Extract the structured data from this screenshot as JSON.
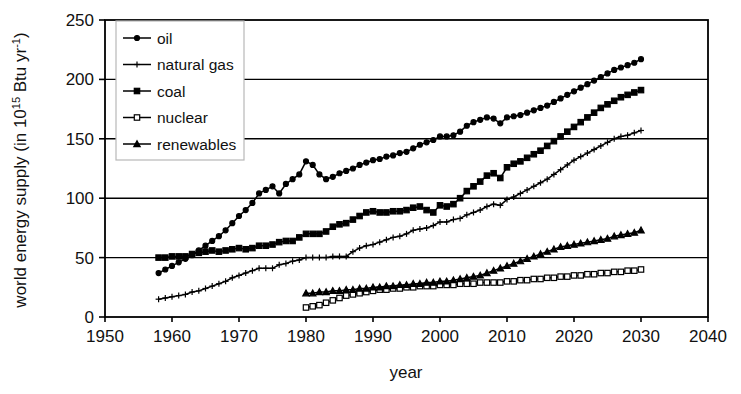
{
  "chart_data": {
    "type": "line",
    "title": "",
    "xlabel": "year",
    "ylabel_plain": "world energy supply (in 10^15 Btu yr^-1)",
    "ylabel_parts": {
      "pre": "world energy supply (in 10",
      "exp1": "15",
      "mid": " Btu yr",
      "exp2": "-1",
      "post": ")"
    },
    "xlim": [
      1950,
      2040
    ],
    "ylim": [
      0,
      250
    ],
    "xticks": [
      1950,
      1960,
      1970,
      1980,
      1990,
      2000,
      2010,
      2020,
      2030,
      2040
    ],
    "yticks": [
      0,
      50,
      100,
      150,
      200,
      250
    ],
    "grid": "horizontal",
    "legend_position": "top-left",
    "legend_entries": [
      "oil",
      "natural gas",
      "coal",
      "nuclear",
      "renewables"
    ],
    "series": [
      {
        "name": "oil",
        "marker": "filled-circle",
        "x_start": 1958,
        "x_end": 2030,
        "x": [
          1958,
          1959,
          1960,
          1961,
          1962,
          1963,
          1964,
          1965,
          1966,
          1967,
          1968,
          1969,
          1970,
          1971,
          1972,
          1973,
          1974,
          1975,
          1976,
          1977,
          1978,
          1979,
          1980,
          1981,
          1982,
          1983,
          1984,
          1985,
          1986,
          1987,
          1988,
          1989,
          1990,
          1991,
          1992,
          1993,
          1994,
          1995,
          1996,
          1997,
          1998,
          1999,
          2000,
          2001,
          2002,
          2003,
          2004,
          2005,
          2006,
          2007,
          2008,
          2009,
          2010,
          2011,
          2012,
          2013,
          2014,
          2015,
          2016,
          2017,
          2018,
          2019,
          2020,
          2021,
          2022,
          2023,
          2024,
          2025,
          2026,
          2027,
          2028,
          2029,
          2030
        ],
        "values": [
          37,
          40,
          43,
          46,
          49,
          52,
          56,
          60,
          64,
          68,
          73,
          79,
          85,
          90,
          96,
          104,
          107,
          110,
          104,
          112,
          116,
          120,
          131,
          128,
          120,
          116,
          118,
          121,
          123,
          125,
          128,
          130,
          132,
          133,
          135,
          136,
          138,
          139,
          142,
          145,
          147,
          149,
          152,
          152,
          153,
          156,
          161,
          164,
          166,
          168,
          167,
          163,
          168,
          169,
          170,
          172,
          174,
          176,
          178,
          181,
          184,
          187,
          190,
          193,
          196,
          199,
          202,
          205,
          208,
          210,
          212,
          214,
          217
        ]
      },
      {
        "name": "natural gas",
        "marker": "plus",
        "x_start": 1958,
        "x_end": 2030,
        "x": [
          1958,
          1959,
          1960,
          1961,
          1962,
          1963,
          1964,
          1965,
          1966,
          1967,
          1968,
          1969,
          1970,
          1971,
          1972,
          1973,
          1974,
          1975,
          1976,
          1977,
          1978,
          1979,
          1980,
          1981,
          1982,
          1983,
          1984,
          1985,
          1986,
          1987,
          1988,
          1989,
          1990,
          1991,
          1992,
          1993,
          1994,
          1995,
          1996,
          1997,
          1998,
          1999,
          2000,
          2001,
          2002,
          2003,
          2004,
          2005,
          2006,
          2007,
          2008,
          2009,
          2010,
          2011,
          2012,
          2013,
          2014,
          2015,
          2016,
          2017,
          2018,
          2019,
          2020,
          2021,
          2022,
          2023,
          2024,
          2025,
          2026,
          2027,
          2028,
          2029,
          2030
        ],
        "values": [
          15,
          16,
          17,
          18,
          19,
          21,
          22,
          24,
          26,
          28,
          30,
          33,
          35,
          37,
          39,
          41,
          41,
          41,
          44,
          45,
          47,
          48,
          50,
          50,
          50,
          50,
          51,
          51,
          51,
          55,
          58,
          60,
          61,
          63,
          65,
          67,
          68,
          70,
          73,
          74,
          75,
          77,
          80,
          80,
          82,
          83,
          86,
          88,
          90,
          93,
          95,
          94,
          99,
          101,
          104,
          107,
          110,
          113,
          116,
          120,
          124,
          128,
          132,
          135,
          138,
          141,
          144,
          147,
          150,
          152,
          153,
          155,
          157
        ]
      },
      {
        "name": "coal",
        "marker": "filled-square",
        "x_start": 1958,
        "x_end": 2030,
        "x": [
          1958,
          1959,
          1960,
          1961,
          1962,
          1963,
          1964,
          1965,
          1966,
          1967,
          1968,
          1969,
          1970,
          1971,
          1972,
          1973,
          1974,
          1975,
          1976,
          1977,
          1978,
          1979,
          1980,
          1981,
          1982,
          1983,
          1984,
          1985,
          1986,
          1987,
          1988,
          1989,
          1990,
          1991,
          1992,
          1993,
          1994,
          1995,
          1996,
          1997,
          1998,
          1999,
          2000,
          2001,
          2002,
          2003,
          2004,
          2005,
          2006,
          2007,
          2008,
          2009,
          2010,
          2011,
          2012,
          2013,
          2014,
          2015,
          2016,
          2017,
          2018,
          2019,
          2020,
          2021,
          2022,
          2023,
          2024,
          2025,
          2026,
          2027,
          2028,
          2029,
          2030
        ],
        "values": [
          50,
          50,
          51,
          51,
          51,
          53,
          54,
          55,
          56,
          55,
          56,
          57,
          58,
          57,
          58,
          60,
          60,
          61,
          63,
          64,
          64,
          67,
          70,
          70,
          70,
          72,
          76,
          78,
          79,
          82,
          85,
          88,
          89,
          88,
          88,
          89,
          89,
          90,
          92,
          93,
          90,
          88,
          94,
          93,
          95,
          100,
          106,
          110,
          114,
          119,
          121,
          117,
          126,
          129,
          131,
          134,
          137,
          140,
          144,
          148,
          152,
          156,
          160,
          164,
          168,
          172,
          176,
          179,
          182,
          185,
          187,
          189,
          191
        ]
      },
      {
        "name": "nuclear",
        "marker": "open-square",
        "x_start": 1980,
        "x_end": 2030,
        "x": [
          1980,
          1981,
          1982,
          1983,
          1984,
          1985,
          1986,
          1987,
          1988,
          1989,
          1990,
          1991,
          1992,
          1993,
          1994,
          1995,
          1996,
          1997,
          1998,
          1999,
          2000,
          2001,
          2002,
          2003,
          2004,
          2005,
          2006,
          2007,
          2008,
          2009,
          2010,
          2011,
          2012,
          2013,
          2014,
          2015,
          2016,
          2017,
          2018,
          2019,
          2020,
          2021,
          2022,
          2023,
          2024,
          2025,
          2026,
          2027,
          2028,
          2029,
          2030
        ],
        "values": [
          8,
          9,
          10,
          12,
          14,
          16,
          18,
          19,
          20,
          21,
          22,
          23,
          23,
          24,
          24,
          25,
          25,
          26,
          26,
          26,
          27,
          27,
          27,
          28,
          28,
          28,
          29,
          29,
          29,
          29,
          30,
          30,
          31,
          31,
          32,
          32,
          33,
          33,
          34,
          34,
          35,
          35,
          36,
          36,
          37,
          37,
          38,
          38,
          39,
          39,
          40
        ]
      },
      {
        "name": "renewables",
        "marker": "filled-triangle",
        "x_start": 1980,
        "x_end": 2030,
        "x": [
          1980,
          1981,
          1982,
          1983,
          1984,
          1985,
          1986,
          1987,
          1988,
          1989,
          1990,
          1991,
          1992,
          1993,
          1994,
          1995,
          1996,
          1997,
          1998,
          1999,
          2000,
          2001,
          2002,
          2003,
          2004,
          2005,
          2006,
          2007,
          2008,
          2009,
          2010,
          2011,
          2012,
          2013,
          2014,
          2015,
          2016,
          2017,
          2018,
          2019,
          2020,
          2021,
          2022,
          2023,
          2024,
          2025,
          2026,
          2027,
          2028,
          2029,
          2030
        ],
        "values": [
          20,
          20,
          21,
          21,
          22,
          22,
          23,
          23,
          24,
          24,
          25,
          25,
          26,
          26,
          27,
          27,
          28,
          28,
          29,
          29,
          30,
          30,
          31,
          32,
          33,
          34,
          35,
          37,
          39,
          41,
          43,
          45,
          47,
          49,
          51,
          53,
          55,
          57,
          59,
          60,
          61,
          62,
          63,
          64,
          65,
          66,
          68,
          69,
          70,
          71,
          73
        ]
      }
    ]
  },
  "plot": {
    "left": 105,
    "right": 708,
    "top": 20,
    "bottom": 317
  },
  "legend_box": {
    "x": 116,
    "y": 21,
    "w": 128,
    "h": 139
  }
}
